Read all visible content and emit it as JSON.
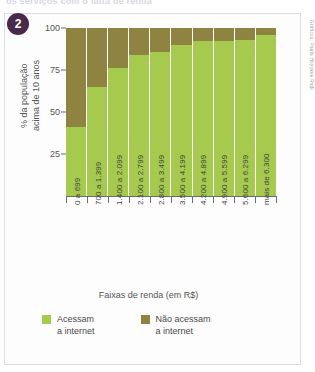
{
  "headline": "os serviços com o falta de renda",
  "badge": {
    "number": "2"
  },
  "credit": "Gráficos: Paula Hoyokee Radi",
  "legend": [
    {
      "label": "Acessam\na internet",
      "color": "#a5ca4e",
      "name": "acessam"
    },
    {
      "label": "Não acessam\na internet",
      "color": "#8e8340",
      "name": "nao-acessam"
    }
  ],
  "chart_data": {
    "type": "bar",
    "stacked": true,
    "title": "",
    "xlabel": "Faixas de renda (em R$)",
    "ylabel": "% da população\nacima de 10 anos",
    "ylim": [
      0,
      100
    ],
    "yticks": [
      25,
      50,
      75,
      100
    ],
    "grid": false,
    "legend_position": "bottom",
    "categories": [
      "0 a 699",
      "700 a 1.399",
      "1.400 a 2.099",
      "2.100 a 2.799",
      "2.800 a 3.499",
      "3.500 a 4.199",
      "4.200 a 4.899",
      "4.900 a 5.599",
      "5.600 a 6.299",
      "mais de 6.300"
    ],
    "series": [
      {
        "name": "Acessam a internet",
        "color": "#a5ca4e",
        "values": [
          41,
          65,
          76,
          84,
          86,
          90,
          92,
          92,
          93,
          96
        ]
      },
      {
        "name": "Não acessam a internet",
        "color": "#8e8340",
        "values": [
          59,
          35,
          24,
          16,
          14,
          10,
          8,
          8,
          7,
          4
        ]
      }
    ]
  }
}
